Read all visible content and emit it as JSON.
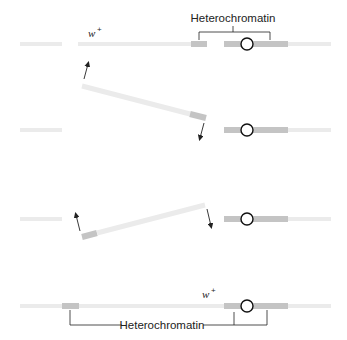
{
  "diagram": {
    "type": "chromosome-inversion-schematic",
    "labels": {
      "heterochromatin_top": "Heterochromatin",
      "heterochromatin_bottom": "Heterochromatin",
      "gene_top": "w",
      "gene_top_sup": "+",
      "gene_bottom": "w",
      "gene_bottom_sup": "+"
    },
    "colors": {
      "euchromatin": "#ebebeb",
      "heterochromatin": "#c4c4c4",
      "centromere_stroke": "#111111",
      "line": "#222222",
      "background": "#ffffff"
    },
    "stages": [
      {
        "name": "original chromosome"
      },
      {
        "name": "chromosome break and segment release"
      },
      {
        "name": "segment rotation (inversion)"
      },
      {
        "name": "inverted chromosome"
      }
    ]
  }
}
